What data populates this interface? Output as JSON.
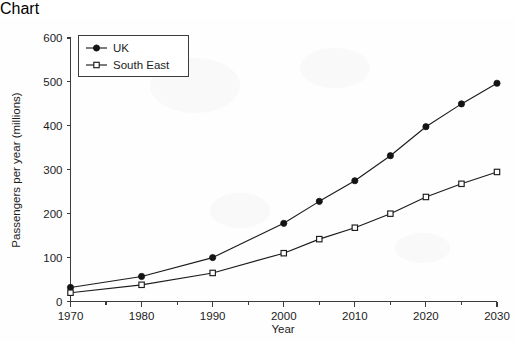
{
  "chart_data": {
    "type": "line",
    "title": "",
    "xlabel": "Year",
    "ylabel": "Passengers per year (millions)",
    "xlim": [
      1970,
      2030
    ],
    "ylim": [
      0,
      600
    ],
    "grid": false,
    "legend_position": "upper-left-inside",
    "x": [
      1970,
      1980,
      1990,
      2000,
      2005,
      2010,
      2015,
      2020,
      2025,
      2030
    ],
    "xticks": [
      1970,
      1980,
      1990,
      2000,
      2010,
      2020,
      2030
    ],
    "xtick_labels": [
      "1970",
      "1980",
      "1990",
      "2000",
      "2010",
      "2020",
      "2030"
    ],
    "xminor_ticks": [
      1975,
      1985,
      1995,
      2005,
      2015,
      2025
    ],
    "yticks": [
      0,
      100,
      200,
      300,
      400,
      500,
      600
    ],
    "ytick_labels": [
      "0",
      "100",
      "200",
      "300",
      "400",
      "500",
      "600"
    ],
    "series": [
      {
        "name": "UK",
        "marker": "filled-circle",
        "values": [
          32,
          57,
          100,
          178,
          228,
          275,
          332,
          398,
          450,
          497
        ]
      },
      {
        "name": "South East",
        "marker": "open-square",
        "values": [
          20,
          38,
          65,
          110,
          142,
          168,
          200,
          238,
          268,
          295
        ]
      }
    ],
    "colors": {
      "line": "#1c1c1c",
      "axis": "#3b3b3b",
      "background": "#fefefe",
      "marker_fill_open": "#ffffff"
    }
  },
  "legend": {
    "entries": [
      {
        "label": "UK",
        "marker": "filled-circle"
      },
      {
        "label": "South East",
        "marker": "open-square"
      }
    ]
  }
}
